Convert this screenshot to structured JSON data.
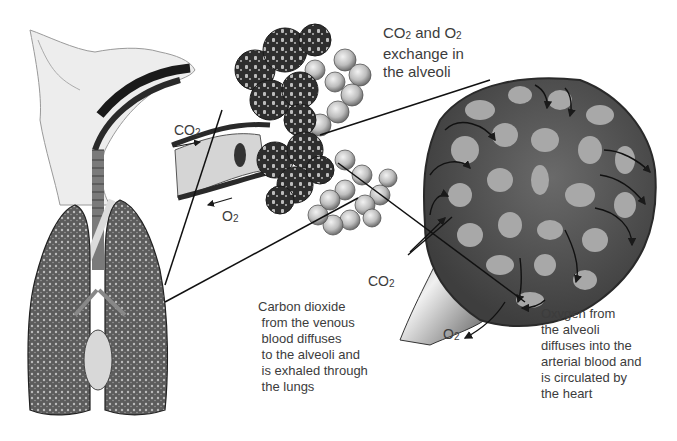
{
  "diagram": {
    "title_label": {
      "line1_prefix": "CO",
      "line1_sub1": "2",
      "line1_mid": " and O",
      "line1_sub2": "2",
      "line2": "exchange in",
      "line3": "the alveoli"
    },
    "chem_labels": {
      "co2_bronchus": {
        "base": "CO",
        "sub": "2"
      },
      "o2_bronchus": {
        "base": "O",
        "sub": "2"
      },
      "co2_capillary": {
        "base": "CO",
        "sub": "2"
      },
      "o2_capillary": {
        "base": "O",
        "sub": "2"
      }
    },
    "caption_co2": {
      "lines": [
        "Carbon dioxide",
        " from the venous",
        " blood diffuses",
        " to the alveoli and",
        " is exhaled through",
        " the lungs"
      ]
    },
    "caption_o2": {
      "lines": [
        "Oxygen from",
        "the alveoli",
        "diffuses into the",
        "arterial blood and",
        "is circulated by",
        "the heart"
      ]
    },
    "parts": [
      "dog-head-and-respiratory-tract",
      "lungs",
      "bronchiole",
      "alveoli-cluster",
      "magnified-alveolus-with-capillaries"
    ],
    "colors": {
      "background": "#ffffff",
      "text": "#3c3c3c",
      "leader_line": "#111111",
      "capillary_dark": "#4a4a4a",
      "alveolus_light": "#a8a8a8"
    }
  }
}
